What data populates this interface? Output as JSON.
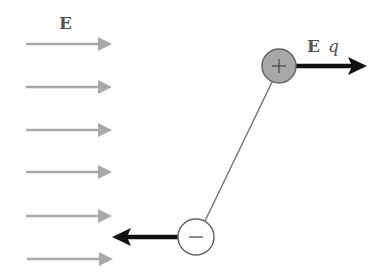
{
  "diagram": {
    "field_label": "E",
    "force_label": {
      "field": "E",
      "charge": "q"
    },
    "field_arrows_y": [
      44,
      87,
      130,
      172,
      216,
      259
    ],
    "positive_charge": {
      "symbol": "+",
      "cx": 279,
      "cy": 66,
      "r": 17
    },
    "negative_charge": {
      "symbol": "−",
      "cx": 196,
      "cy": 237,
      "r": 18
    },
    "colors": {
      "field_arrow": "#a9a9a9",
      "force_arrow": "#111111",
      "positive_fill": "#a8a8a8",
      "negative_fill": "#ffffff",
      "outline": "#666666",
      "rod": "#777777",
      "label": "#555555"
    }
  }
}
